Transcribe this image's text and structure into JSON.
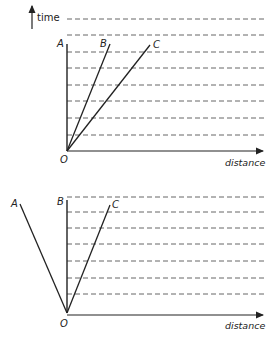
{
  "top_diagram": {
    "y_axis_label": "time",
    "x_axis_label": "distance",
    "origin_label": "O",
    "lines": [
      {
        "label": "A",
        "description": "vertical line along time axis"
      },
      {
        "label": "B",
        "description": "steep line from origin"
      },
      {
        "label": "C",
        "description": "less steep line from origin"
      }
    ],
    "dashed_gridline_count": 8
  },
  "bottom_diagram": {
    "x_axis_label": "distance",
    "origin_label": "O",
    "lines": [
      {
        "label": "A",
        "description": "line sloping left from origin"
      },
      {
        "label": "B",
        "description": "vertical line"
      },
      {
        "label": "C",
        "description": "line sloping right from origin"
      }
    ],
    "dashed_gridline_count": 7
  },
  "colors": {
    "ink": "#222222",
    "dash": "#555555",
    "background": "#ffffff"
  }
}
